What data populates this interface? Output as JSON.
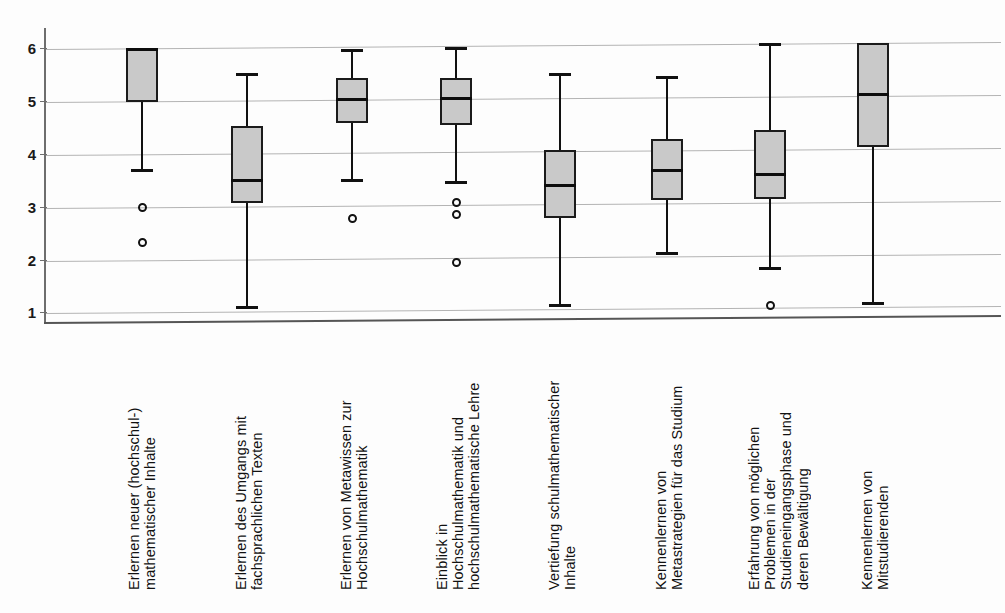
{
  "chart_data": {
    "type": "box",
    "title": "",
    "xlabel": "",
    "ylabel": "",
    "ylim": [
      1,
      6.4
    ],
    "yticks": [
      1,
      2,
      3,
      4,
      5,
      6
    ],
    "ytick_labels": [
      "1",
      "2",
      "3",
      "4",
      "5",
      "6"
    ],
    "grid": true,
    "legend": "none",
    "box_fill_color": "#c9c9c9",
    "box_line_color": "#1b1b1b",
    "grid_color": "#b4b4b4",
    "categories": [
      "Erlernen neuer (hochschul-)\nmathematischer Inhalte",
      "Erlernen des Umgangs mit\nfachsprachlichen Texten",
      "Erlernen von Metawissen zur\nHochschulmathematik",
      "Einblick in\nHochschulmathematik und\nhochschulmathematische Lehre",
      "Vertiefung schulmathematischer\nInhalte",
      "Kennenlernen von\nMetastrategien für das Studium",
      "Erfahrung von möglichen\nProblemen in der\nStudieneingangsphase und\nderen Bewältigung",
      "Kennenlernen von\nMitstudierenden"
    ],
    "boxes": [
      {
        "category": "Erlernen neuer (hochschul-) mathematischer Inhalte",
        "whisker_high": 6.0,
        "q3": 6.0,
        "median": 6.0,
        "q1": 5.0,
        "whisker_low": 3.7,
        "outliers": [
          3.0,
          2.35
        ]
      },
      {
        "category": "Erlernen des Umgangs mit fachsprachlichen Texten",
        "whisker_high": 5.55,
        "q3": 4.55,
        "median": 3.53,
        "q1": 3.08,
        "whisker_low": 1.1,
        "outliers": []
      },
      {
        "category": "Erlernen von Metawissen zur Hochschulmathematik",
        "whisker_high": 6.0,
        "q3": 5.45,
        "median": 5.06,
        "q1": 4.6,
        "whisker_low": 3.5,
        "outliers": [
          2.8
        ]
      },
      {
        "category": "Einblick in Hochschulmathematik und hochschulmathematische Lehre",
        "whisker_high": 6.05,
        "q3": 5.45,
        "median": 5.07,
        "q1": 4.57,
        "whisker_low": 3.47,
        "outliers": [
          3.1,
          2.87,
          1.97
        ]
      },
      {
        "category": "Vertiefung schulmathematischer Inhalte",
        "whisker_high": 5.55,
        "q3": 4.1,
        "median": 3.43,
        "q1": 2.8,
        "whisker_low": 1.13,
        "outliers": []
      },
      {
        "category": "Kennenlernen von Metastrategien für das Studium",
        "whisker_high": 5.5,
        "q3": 4.3,
        "median": 3.72,
        "q1": 3.15,
        "whisker_low": 2.13,
        "outliers": []
      },
      {
        "category": "Erfahrung von möglichen Problemen in der Studieneingangsphase und deren Bewältigung",
        "whisker_high": 6.12,
        "q3": 4.48,
        "median": 3.63,
        "q1": 3.17,
        "whisker_low": 1.83,
        "outliers": [
          1.15
        ]
      },
      {
        "category": "Kennenlernen von Mitstudierenden",
        "whisker_high": 6.12,
        "q3": 6.12,
        "median": 5.15,
        "q1": 4.15,
        "whisker_low": 1.18,
        "outliers": []
      }
    ]
  },
  "layout": {
    "box_centers_px": [
      142,
      247,
      352,
      456,
      560,
      667,
      770,
      873
    ],
    "box_width_px": 32,
    "y_axis_px": {
      "v1": 313.3,
      "v6": 49.3
    }
  }
}
